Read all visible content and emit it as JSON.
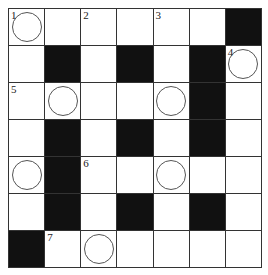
{
  "puzzle": {
    "rows": 7,
    "cols": 7,
    "grid": [
      [
        "1C",
        "W",
        "2",
        "W",
        "3",
        "W",
        "B"
      ],
      [
        "W",
        "B",
        "W",
        "B",
        "W",
        "B",
        "4C"
      ],
      [
        "5",
        "C",
        "W",
        "W",
        "C",
        "B",
        "W"
      ],
      [
        "W",
        "B",
        "W",
        "B",
        "W",
        "B",
        "W"
      ],
      [
        "C",
        "B",
        "6",
        "W",
        "C",
        "W",
        "W"
      ],
      [
        "W",
        "B",
        "W",
        "B",
        "W",
        "B",
        "W"
      ],
      [
        "B",
        "7",
        "C",
        "W",
        "W",
        "W",
        "W"
      ]
    ],
    "legend": {
      "B": "black",
      "W": "white",
      "C": "circled",
      "number": "clue number"
    }
  }
}
